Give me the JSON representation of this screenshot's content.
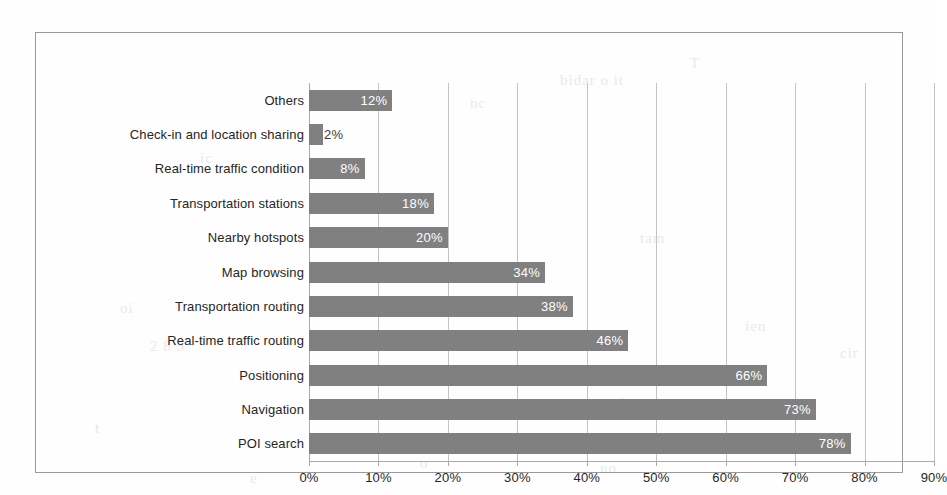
{
  "chart_data": {
    "type": "bar",
    "orientation": "horizontal",
    "title": "",
    "subtitle": "",
    "xlabel": "",
    "ylabel": "",
    "xlim": [
      0,
      90
    ],
    "xtick_labels": [
      "0%",
      "10%",
      "20%",
      "30%",
      "40%",
      "50%",
      "60%",
      "70%",
      "80%",
      "90%"
    ],
    "xtick_values": [
      0,
      10,
      20,
      30,
      40,
      50,
      60,
      70,
      80,
      90
    ],
    "grid": true,
    "grid_axis": "x",
    "legend": false,
    "legend_position": "none",
    "bar_color": "#808080",
    "gridline_color": "#c3c3c5",
    "axis_color": "#a9a9ab",
    "border_color": "#9a9a9a",
    "label_color": "#262626",
    "value_label_color": "#ffffff",
    "categories": [
      "Others",
      "Check-in and location sharing",
      "Real-time traffic condition",
      "Transportation stations",
      "Nearby hotspots",
      "Map browsing",
      "Transportation routing",
      "Real-time traffic routing",
      "Positioning",
      "Navigation",
      "POI search"
    ],
    "values": [
      12,
      2,
      8,
      18,
      20,
      34,
      38,
      46,
      66,
      73,
      78
    ],
    "value_labels": [
      "12%",
      "2%",
      "8%",
      "18%",
      "20%",
      "34%",
      "38%",
      "46%",
      "66%",
      "73%",
      "78%"
    ]
  },
  "scan_artifacts": [
    {
      "text": "T",
      "x": 690,
      "y": 55
    },
    {
      "text": "bidar   o it",
      "x": 560,
      "y": 72
    },
    {
      "text": "nc",
      "x": 470,
      "y": 95
    },
    {
      "text": "ic",
      "x": 200,
      "y": 150
    },
    {
      "text": "tam",
      "x": 640,
      "y": 230
    },
    {
      "text": "oi",
      "x": 120,
      "y": 300
    },
    {
      "text": "ien",
      "x": 745,
      "y": 318
    },
    {
      "text": "2 8 5",
      "x": 150,
      "y": 338
    },
    {
      "text": "cir",
      "x": 840,
      "y": 345
    },
    {
      "text": "kc",
      "x": 620,
      "y": 395
    },
    {
      "text": "t",
      "x": 95,
      "y": 420
    },
    {
      "text": "o",
      "x": 420,
      "y": 455
    },
    {
      "text": "no",
      "x": 600,
      "y": 460
    },
    {
      "text": "e",
      "x": 250,
      "y": 470
    }
  ]
}
